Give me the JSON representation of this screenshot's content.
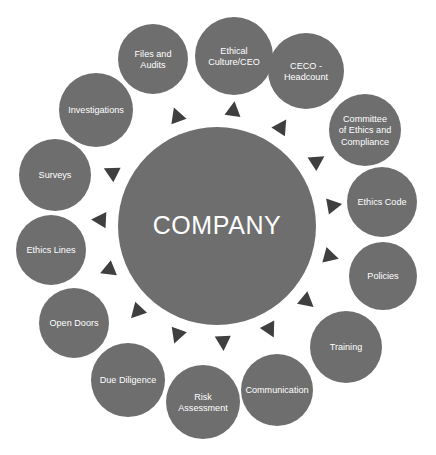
{
  "diagram": {
    "type": "radial-hub-and-spoke",
    "title": "COMPANY",
    "colors": {
      "background": "#ffffff",
      "node_fill": "#6e6e6e",
      "hub_fill": "#6e6e6e",
      "arrow_fill": "#3f3f3f",
      "label_text": "#ffffff"
    },
    "hub": {
      "label": "COMPANY",
      "cx": 217,
      "cy": 226,
      "r": 99
    },
    "nodes": [
      {
        "id": "ethical-culture-ceo",
        "label": "Ethical Culture/CEO",
        "lines": [
          "Ethical",
          "Culture/CEO"
        ],
        "cx": 234,
        "cy": 56,
        "r": 39,
        "angle": -84
      },
      {
        "id": "ceco-headcount",
        "label": "CECO - Headcount",
        "lines": [
          "CECO -",
          "Headcount"
        ],
        "cx": 306,
        "cy": 71,
        "r": 38,
        "angle": -60
      },
      {
        "id": "committee-of-ethics-and-compliance",
        "label": "Committee of Ethics and Compliance",
        "lines": [
          "Committee",
          "of Ethics and",
          "Compliance"
        ],
        "cx": 365,
        "cy": 130,
        "r": 36,
        "angle": -35
      },
      {
        "id": "ethics-code",
        "label": "Ethics Code",
        "lines": [
          "Ethics Code"
        ],
        "cx": 382,
        "cy": 202,
        "r": 35,
        "angle": -13
      },
      {
        "id": "policies",
        "label": "Policies",
        "lines": [
          "Policies"
        ],
        "cx": 383,
        "cy": 276,
        "r": 34,
        "angle": 12
      },
      {
        "id": "training",
        "label": "Training",
        "lines": [
          "Training"
        ],
        "cx": 346,
        "cy": 347,
        "r": 36,
        "angle": 37
      },
      {
        "id": "communication",
        "label": "Communication",
        "lines": [
          "Communication"
        ],
        "cx": 277,
        "cy": 390,
        "r": 36,
        "angle": 60
      },
      {
        "id": "risk-assessment",
        "label": "Risk Assessment",
        "lines": [
          "Risk",
          "Assessment"
        ],
        "cx": 203,
        "cy": 402,
        "r": 37,
        "angle": 83
      },
      {
        "id": "due-diligence",
        "label": "Due Diligence",
        "lines": [
          "Due Diligence"
        ],
        "cx": 128,
        "cy": 380,
        "r": 37,
        "angle": 106
      },
      {
        "id": "open-doors",
        "label": "Open Doors",
        "lines": [
          "Open Doors"
        ],
        "cx": 74,
        "cy": 323,
        "r": 35,
        "angle": 130
      },
      {
        "id": "ethics-lines",
        "label": "Ethics Lines",
        "lines": [
          "Ethics Lines"
        ],
        "cx": 51,
        "cy": 250,
        "r": 35,
        "angle": 155
      },
      {
        "id": "surveys",
        "label": "Surveys",
        "lines": [
          "Surveys"
        ],
        "cx": 55,
        "cy": 175,
        "r": 36,
        "angle": 180
      },
      {
        "id": "investigations",
        "label": "Investigations",
        "lines": [
          "Investigations"
        ],
        "cx": 96,
        "cy": 110,
        "r": 37,
        "angle": -157
      },
      {
        "id": "files-and-audits",
        "label": "Files and Audits",
        "lines": [
          "Files and",
          "Audits"
        ],
        "cx": 153,
        "cy": 59,
        "r": 35,
        "angle": -115
      }
    ],
    "arrows": [
      {
        "id": "arrow-ethical-culture-ceo",
        "target": "ethical-culture-ceo",
        "angle": -82,
        "dist": 118,
        "size": 13
      },
      {
        "id": "arrow-ceco-headcount",
        "target": "ceco-headcount",
        "angle": -57,
        "dist": 119,
        "size": 13
      },
      {
        "id": "arrow-committee",
        "target": "committee-of-ethics-and-compliance",
        "angle": -33,
        "dist": 120,
        "size": 13
      },
      {
        "id": "arrow-ethics-code",
        "target": "ethics-code",
        "angle": -10,
        "dist": 119,
        "size": 13
      },
      {
        "id": "arrow-policies",
        "target": "policies",
        "angle": 15,
        "dist": 118,
        "size": 13
      },
      {
        "id": "arrow-training",
        "target": "training",
        "angle": 40,
        "dist": 118,
        "size": 13
      },
      {
        "id": "arrow-communication",
        "target": "communication",
        "angle": 63,
        "dist": 117,
        "size": 13
      },
      {
        "id": "arrow-risk-assessment",
        "target": "risk-assessment",
        "angle": 87,
        "dist": 117,
        "size": 13
      },
      {
        "id": "arrow-due-diligence",
        "target": "due-diligence",
        "angle": 110,
        "dist": 117,
        "size": 13
      },
      {
        "id": "arrow-open-doors",
        "target": "open-doors",
        "angle": 133,
        "dist": 118,
        "size": 13
      },
      {
        "id": "arrow-ethics-lines",
        "target": "ethics-lines",
        "angle": 158,
        "dist": 118,
        "size": 13
      },
      {
        "id": "arrow-surveys",
        "target": "surveys",
        "angle": -177,
        "dist": 118,
        "size": 13
      },
      {
        "id": "arrow-investigations",
        "target": "investigations",
        "angle": -153,
        "dist": 119,
        "size": 13
      },
      {
        "id": "arrow-files-and-audits",
        "target": "files-and-audits",
        "angle": -110,
        "dist": 118,
        "size": 13
      }
    ]
  }
}
